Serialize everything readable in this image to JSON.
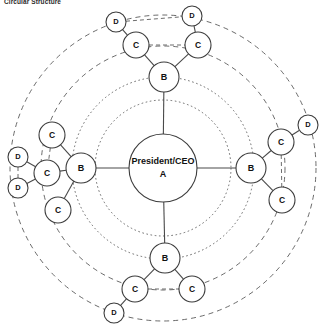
{
  "title": "Circular Structure",
  "colors": {
    "background": "#ffffff",
    "node_fill": "#ffffff",
    "node_stroke": "#3c3c3c",
    "link_solid": "#4a4a4a",
    "link_dashed": "#6d6d6d",
    "ring_stroke": "#5a5a5a",
    "text": "#111111"
  },
  "chart_data": {
    "type": "diagram",
    "subtype": "circular-organizational-chart",
    "title": "Circular Structure",
    "center": {
      "x": 163,
      "y": 168
    },
    "rings": [
      {
        "name": "inner-dotted-ring",
        "radius": 68,
        "style": "dotted"
      },
      {
        "name": "b-tier-ring",
        "radius": 91,
        "style": "dotted"
      },
      {
        "name": "c-tier-ring",
        "radius": 122,
        "style": "dashed"
      },
      {
        "name": "d-tier-ring",
        "radius": 153,
        "style": "dashed"
      }
    ],
    "nodes": [
      {
        "id": "A",
        "label_line1": "President/CEO",
        "label_line2": "A",
        "tier": "A",
        "x": 163,
        "y": 168,
        "r": 34
      },
      {
        "id": "B_top",
        "label": "B",
        "tier": "B",
        "x": 164,
        "y": 77,
        "r": 15
      },
      {
        "id": "B_left",
        "label": "B",
        "tier": "B",
        "x": 81,
        "y": 168,
        "r": 15
      },
      {
        "id": "B_right",
        "label": "B",
        "tier": "B",
        "x": 251,
        "y": 168,
        "r": 15
      },
      {
        "id": "B_bottom",
        "label": "B",
        "tier": "B",
        "x": 165,
        "y": 258,
        "r": 15
      },
      {
        "id": "C_top_left",
        "label": "C",
        "tier": "C",
        "x": 136,
        "y": 45,
        "r": 13
      },
      {
        "id": "C_top_right",
        "label": "C",
        "tier": "C",
        "x": 198,
        "y": 45,
        "r": 13
      },
      {
        "id": "C_left_upper",
        "label": "C",
        "tier": "C",
        "x": 52,
        "y": 135,
        "r": 13
      },
      {
        "id": "C_left_middle",
        "label": "C",
        "tier": "C",
        "x": 47,
        "y": 173,
        "r": 13
      },
      {
        "id": "C_left_lower",
        "label": "C",
        "tier": "C",
        "x": 58,
        "y": 210,
        "r": 13
      },
      {
        "id": "C_right_upper",
        "label": "C",
        "tier": "C",
        "x": 281,
        "y": 142,
        "r": 13
      },
      {
        "id": "C_right_lower",
        "label": "C",
        "tier": "C",
        "x": 282,
        "y": 200,
        "r": 13
      },
      {
        "id": "C_bottom_left",
        "label": "C",
        "tier": "C",
        "x": 135,
        "y": 289,
        "r": 13
      },
      {
        "id": "C_bottom_right",
        "label": "C",
        "tier": "C",
        "x": 192,
        "y": 289,
        "r": 13
      },
      {
        "id": "D_top_left",
        "label": "D",
        "tier": "D",
        "x": 116,
        "y": 22,
        "r": 10
      },
      {
        "id": "D_top_right",
        "label": "D",
        "tier": "D",
        "x": 192,
        "y": 16,
        "r": 10
      },
      {
        "id": "D_left_upper",
        "label": "D",
        "tier": "D",
        "x": 18,
        "y": 157,
        "r": 10
      },
      {
        "id": "D_left_lower",
        "label": "D",
        "tier": "D",
        "x": 18,
        "y": 188,
        "r": 10
      },
      {
        "id": "D_right",
        "label": "D",
        "tier": "D",
        "x": 308,
        "y": 125,
        "r": 10
      },
      {
        "id": "D_bottom",
        "label": "D",
        "tier": "D",
        "x": 114,
        "y": 313,
        "r": 10
      }
    ],
    "links": [
      {
        "from": "A",
        "to": "B_top",
        "style": "solid"
      },
      {
        "from": "A",
        "to": "B_left",
        "style": "solid"
      },
      {
        "from": "A",
        "to": "B_right",
        "style": "solid"
      },
      {
        "from": "A",
        "to": "B_bottom",
        "style": "solid"
      },
      {
        "from": "B_top",
        "to": "C_top_left",
        "style": "solid"
      },
      {
        "from": "B_top",
        "to": "C_top_right",
        "style": "solid"
      },
      {
        "from": "C_top_left",
        "to": "C_top_right",
        "style": "dashed"
      },
      {
        "from": "C_top_left",
        "to": "D_top_left",
        "style": "solid"
      },
      {
        "from": "C_top_right",
        "to": "D_top_right",
        "style": "solid"
      },
      {
        "from": "D_top_left",
        "to": "D_top_right",
        "style": "dashed"
      },
      {
        "from": "B_left",
        "to": "C_left_upper",
        "style": "solid"
      },
      {
        "from": "B_left",
        "to": "C_left_middle",
        "style": "solid"
      },
      {
        "from": "B_left",
        "to": "C_left_lower",
        "style": "solid"
      },
      {
        "from": "C_left_upper",
        "to": "C_left_middle",
        "style": "dashed"
      },
      {
        "from": "C_left_middle",
        "to": "D_left_upper",
        "style": "solid"
      },
      {
        "from": "C_left_middle",
        "to": "D_left_lower",
        "style": "solid"
      },
      {
        "from": "D_left_upper",
        "to": "D_left_lower",
        "style": "dashed"
      },
      {
        "from": "B_right",
        "to": "C_right_upper",
        "style": "solid"
      },
      {
        "from": "B_right",
        "to": "C_right_lower",
        "style": "solid"
      },
      {
        "from": "C_right_upper",
        "to": "C_right_lower",
        "style": "dashed"
      },
      {
        "from": "C_right_upper",
        "to": "D_right",
        "style": "solid"
      },
      {
        "from": "B_bottom",
        "to": "C_bottom_left",
        "style": "solid"
      },
      {
        "from": "B_bottom",
        "to": "C_bottom_right",
        "style": "solid"
      },
      {
        "from": "C_bottom_left",
        "to": "C_bottom_right",
        "style": "dashed"
      },
      {
        "from": "C_bottom_left",
        "to": "D_bottom",
        "style": "solid"
      }
    ]
  }
}
